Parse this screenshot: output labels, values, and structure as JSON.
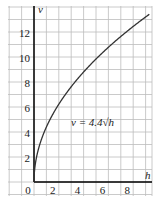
{
  "chart_data": {
    "type": "line",
    "title": "",
    "xlabel": "h",
    "ylabel": "v",
    "equation_label": "v = 4.4√h",
    "function": "v = 4.4*sqrt(h)",
    "x_ticks": [
      "0",
      "2",
      "4",
      "6",
      "8"
    ],
    "y_ticks": [
      "2",
      "4",
      "6",
      "8",
      "10",
      "12"
    ],
    "xlim": [
      0,
      9.3
    ],
    "ylim": [
      0,
      14
    ],
    "grid": true,
    "series": [
      {
        "name": "v = 4.4√h",
        "x": [
          0,
          0.25,
          0.5,
          1,
          2,
          3,
          4,
          5,
          6,
          7,
          8,
          9,
          9.3
        ],
        "y": [
          0,
          2.2,
          3.11,
          4.4,
          6.22,
          7.62,
          8.8,
          9.84,
          10.78,
          11.64,
          12.45,
          13.2,
          13.42
        ]
      }
    ],
    "colors": {
      "grid": "#b8b8b8",
      "axis": "#000000",
      "curve": "#333333"
    }
  }
}
